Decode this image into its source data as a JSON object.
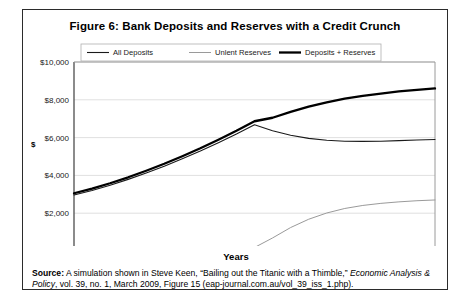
{
  "figure": {
    "title": "Figure 6: Bank Deposits and Reserves with a Credit Crunch",
    "source_label": "Source:",
    "source_text_1": " A simulation shown in Steve Keen, “Bailing out the Titanic with a Thimble,” ",
    "source_italic_1": "Economic Analysis & Policy",
    "source_text_2": ", vol. 39, no. 1, March 2009, Figure 15 (eap-journal.com.au/vol_39_iss_1.php)."
  },
  "chart_data": {
    "type": "line",
    "title": "Figure 6: Bank Deposits and Reserves with a Credit Crunch",
    "xlabel": "Years",
    "ylabel": "$",
    "xlim": [
      20,
      40
    ],
    "ylim": [
      0,
      10000
    ],
    "xticks": [
      20,
      25,
      30,
      35,
      40
    ],
    "xticklabels": [
      "20",
      "25",
      "30",
      "35",
      "40"
    ],
    "yticks": [
      0,
      2000,
      4000,
      6000,
      8000,
      10000
    ],
    "yticklabels": [
      "0",
      "$2,000",
      "$4,000",
      "$6,000",
      "$8,000",
      "$10,000"
    ],
    "grid": true,
    "legend_position": "top-center-inside",
    "x": [
      20,
      21,
      22,
      23,
      24,
      25,
      26,
      27,
      28,
      29,
      30,
      31,
      32,
      33,
      34,
      35,
      36,
      37,
      38,
      39,
      40
    ],
    "series": [
      {
        "name": "All Deposits",
        "color": "#1a1a1a",
        "width": 1.1,
        "values": [
          2960,
          3200,
          3480,
          3790,
          4130,
          4490,
          4880,
          5290,
          5730,
          6190,
          6680,
          6360,
          6120,
          5960,
          5860,
          5810,
          5800,
          5810,
          5840,
          5870,
          5900
        ]
      },
      {
        "name": "Unlent Reserves",
        "color": "#9a9a9a",
        "width": 1.0,
        "values": [
          95,
          100,
          105,
          110,
          118,
          126,
          135,
          146,
          158,
          170,
          185,
          690,
          1240,
          1680,
          2010,
          2250,
          2410,
          2520,
          2600,
          2660,
          2700
        ]
      },
      {
        "name": "Deposits + Reserves",
        "color": "#000000",
        "width": 2.3,
        "values": [
          3055,
          3300,
          3585,
          3900,
          4248,
          4616,
          5015,
          5436,
          5888,
          6360,
          6865,
          7050,
          7360,
          7640,
          7870,
          8060,
          8210,
          8330,
          8440,
          8530,
          8600
        ]
      }
    ]
  }
}
